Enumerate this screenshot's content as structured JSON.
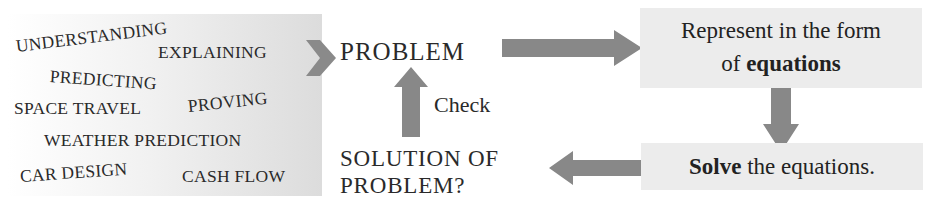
{
  "diagram": {
    "applications": {
      "items": [
        {
          "label": "UNDERSTANDING"
        },
        {
          "label": "EXPLAINING"
        },
        {
          "label": "PREDICTING"
        },
        {
          "label": "SPACE TRAVEL"
        },
        {
          "label": "PROVING"
        },
        {
          "label": "WEATHER PREDICTION"
        },
        {
          "label": "CAR DESIGN"
        },
        {
          "label": "CASH FLOW"
        }
      ]
    },
    "nodes": {
      "problem": "PROBLEM",
      "represent_prefix": "Represent in the form",
      "represent_of": "of",
      "represent_bold": "equations",
      "solve_bold": "Solve",
      "solve_rest": " the equations.",
      "solution_line1": "SOLUTION OF",
      "solution_line2": "PROBLEM?",
      "check": "Check"
    },
    "colors": {
      "arrow": "#888888",
      "box_fill": "#ececec",
      "text": "#222222"
    }
  }
}
